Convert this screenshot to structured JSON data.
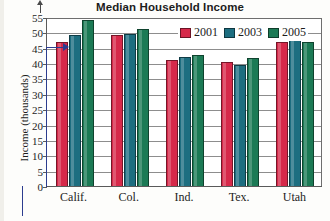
{
  "chart_data": {
    "type": "bar",
    "title": "Median Household Income",
    "xlabel": "",
    "ylabel": "Income (thousands)",
    "categories": [
      "Calif.",
      "Col.",
      "Ind.",
      "Tex.",
      "Utah"
    ],
    "series": [
      {
        "name": "2001",
        "color": "#d6294a",
        "values": [
          47,
          49,
          41,
          40.5,
          47
        ]
      },
      {
        "name": "2003",
        "color": "#1d6e80",
        "values": [
          49,
          49.5,
          42,
          39.5,
          49
        ]
      },
      {
        "name": "2005",
        "color": "#1c7a55",
        "values": [
          54,
          51,
          42.5,
          41.5,
          47
        ]
      }
    ],
    "ylim": [
      0,
      55
    ],
    "yticks": [
      0,
      5,
      10,
      15,
      20,
      25,
      30,
      35,
      40,
      45,
      50,
      55
    ],
    "ytick_labels": [
      "0",
      "5",
      "10",
      "15",
      "20",
      "25",
      "30",
      "35",
      "40",
      "45",
      "50",
      "55"
    ],
    "grid": true,
    "legend_position": "top-right",
    "legend_entries": [
      "2001",
      "2003",
      "2005"
    ],
    "annotations": [
      {
        "name": "value-callout-arrow",
        "description": "blue arrow pointing to top of Calif. 2001 bar",
        "value": 47,
        "color": "#2c3d8f"
      }
    ]
  }
}
